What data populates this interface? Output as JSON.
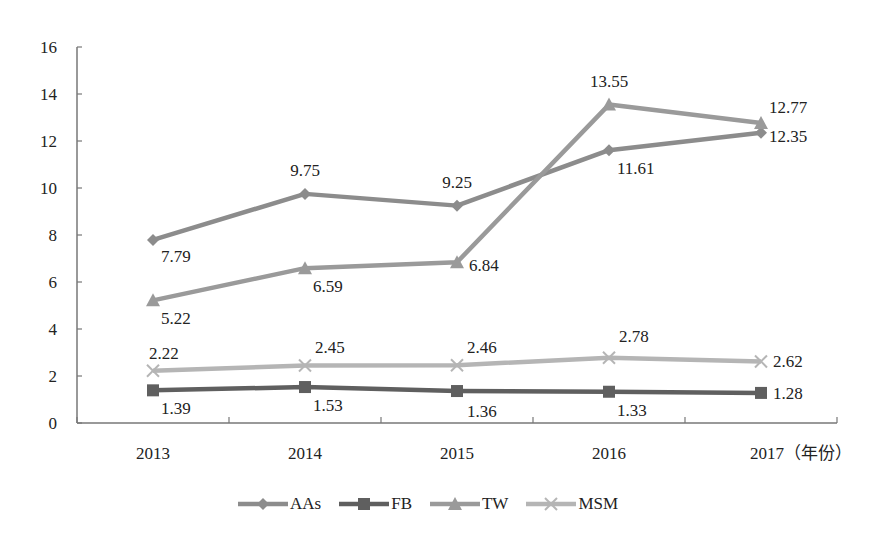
{
  "chart_data": {
    "type": "line",
    "title": "",
    "xlabel": "(年份)",
    "ylabel": "",
    "categories": [
      "2013",
      "2014",
      "2015",
      "2016",
      "2017"
    ],
    "ylim": [
      0,
      16
    ],
    "yticks": [
      0,
      2,
      4,
      6,
      8,
      10,
      12,
      14,
      16
    ],
    "grid": false,
    "legend_position": "bottom",
    "series": [
      {
        "name": "AAs",
        "marker": "diamond",
        "color": "#8c8c8c",
        "values": [
          7.79,
          9.75,
          9.25,
          11.61,
          12.35
        ]
      },
      {
        "name": "FB",
        "marker": "square",
        "color": "#5f5f5f",
        "values": [
          1.39,
          1.53,
          1.36,
          1.33,
          1.28
        ]
      },
      {
        "name": "TW",
        "marker": "triangle",
        "color": "#9a9a9a",
        "values": [
          5.22,
          6.59,
          6.84,
          13.55,
          12.77
        ]
      },
      {
        "name": "MSM",
        "marker": "x",
        "color": "#b5b5b5",
        "values": [
          2.22,
          2.45,
          2.46,
          2.78,
          2.62
        ]
      }
    ]
  },
  "axis": {
    "x_last_label": "2017（年份）"
  }
}
